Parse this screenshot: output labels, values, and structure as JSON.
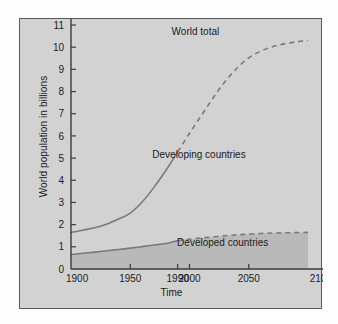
{
  "figure": {
    "panel_background": "#d2d2d2",
    "page_background": "#fdfdfd",
    "border_color": "#5a5a5a",
    "curve_color": "#7a7a7a",
    "fill_color": "#b9b9b9",
    "text_color": "#1b1b1b"
  },
  "chart_data": {
    "type": "line",
    "title": "",
    "subtitle": "",
    "xlabel": "Time",
    "ylabel": "World population in billions",
    "xlim": [
      1900,
      2100
    ],
    "ylim": [
      0,
      11
    ],
    "grid": false,
    "legend_position": "inline-annotations",
    "x_ticks": [
      1900,
      1950,
      1990,
      2000,
      2050,
      2100
    ],
    "x_tick_labels": [
      "1900",
      "1950",
      "1990",
      "2000",
      "2050",
      "2100"
    ],
    "y_ticks": [
      0,
      1,
      2,
      3,
      4,
      5,
      6,
      7,
      8,
      9,
      10,
      11
    ],
    "y_tick_labels": [
      "0",
      "1",
      "2",
      "3",
      "4",
      "5",
      "6",
      "7",
      "8",
      "9",
      "10",
      "11"
    ],
    "historical_projection_split_year": 1990,
    "annotations": [
      {
        "text": "World total",
        "x": 2005,
        "y": 10.55
      },
      {
        "text": "Developing countries",
        "x": 2008,
        "y": 5.0
      },
      {
        "text": "Developed countries",
        "x": 2028,
        "y": 1.05
      }
    ],
    "series": [
      {
        "name": "World total",
        "style": "solid-then-dashed",
        "x": [
          1900,
          1910,
          1920,
          1930,
          1940,
          1950,
          1960,
          1970,
          1980,
          1990,
          2000,
          2010,
          2020,
          2030,
          2040,
          2050,
          2060,
          2070,
          2080,
          2090,
          2100
        ],
        "values": [
          1.65,
          1.75,
          1.86,
          2.02,
          2.25,
          2.52,
          3.02,
          3.68,
          4.44,
          5.28,
          6.12,
          6.92,
          7.72,
          8.45,
          9.05,
          9.52,
          9.82,
          10.02,
          10.15,
          10.24,
          10.3
        ]
      },
      {
        "name": "Developed countries",
        "style": "solid-then-dashed",
        "x": [
          1900,
          1910,
          1920,
          1930,
          1940,
          1950,
          1960,
          1970,
          1980,
          1990,
          2000,
          2010,
          2020,
          2030,
          2040,
          2050,
          2060,
          2070,
          2080,
          2090,
          2100
        ],
        "values": [
          0.65,
          0.71,
          0.76,
          0.82,
          0.88,
          0.94,
          1.01,
          1.08,
          1.15,
          1.28,
          1.34,
          1.4,
          1.45,
          1.5,
          1.54,
          1.57,
          1.6,
          1.62,
          1.63,
          1.64,
          1.65
        ],
        "filled_below": true
      },
      {
        "name": "Developing countries",
        "style": "implied-band",
        "description": "Region between the developed countries curve and the world total curve"
      }
    ]
  }
}
